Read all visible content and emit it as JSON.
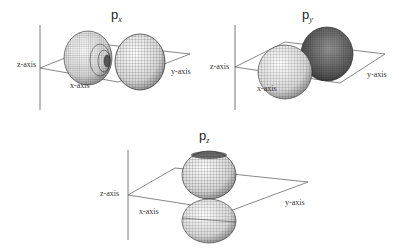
{
  "figure": {
    "panels": [
      {
        "id": "px",
        "title_main": "p",
        "title_sub": "x",
        "axis_labels": {
          "z": "z-axis",
          "x": "x-axis",
          "y": "y-axis"
        }
      },
      {
        "id": "py",
        "title_main": "p",
        "title_sub": "y",
        "axis_labels": {
          "z": "z-axis",
          "x": "x-axis",
          "y": "y-axis"
        }
      },
      {
        "id": "pz",
        "title_main": "p",
        "title_sub": "z",
        "axis_labels": {
          "z": "z-axis",
          "x": "x-axis",
          "y": "y-axis"
        }
      }
    ]
  },
  "colors": {
    "line": "#555555",
    "mesh": "#3a3a3a",
    "lobe_light": "#f2f2f2",
    "lobe_dark": "#6a6a6a"
  }
}
